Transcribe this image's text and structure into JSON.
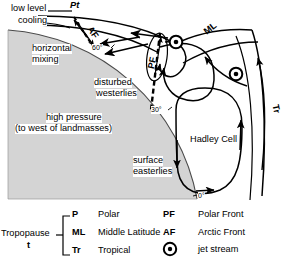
{
  "diagram": {
    "colors": {
      "earth_fill": "#d4d4d4",
      "earth_stroke": "#555555",
      "line": "#000000",
      "background": "#ffffff"
    }
  },
  "annotations": {
    "low_level_cooling": "low level\ncooling",
    "low_level_line1": "low level",
    "low_level_line2": "cooling",
    "pt": "Pt",
    "af": "AF",
    "pf": "PF",
    "ml": "ML",
    "tr": "Tr",
    "horizontal_mixing_1": "horizontal",
    "horizontal_mixing_2": "mixing",
    "disturbed_1": "disturbed",
    "disturbed_2": "westerlies",
    "high_pressure_1": "high pressure",
    "high_pressure_2": "(to west of landmasses)",
    "surface_easterlies_1": "surface",
    "surface_easterlies_2": "easterlies",
    "hadley_cell": "Hadley Cell"
  },
  "latitudes": [
    {
      "label": "60°",
      "value": 60
    },
    {
      "label": "30°",
      "value": 30
    },
    {
      "label": "0°",
      "value": 0
    }
  ],
  "legend": {
    "left": {
      "group_label_1": "Tropopause",
      "group_label_2": "t",
      "items": [
        {
          "code": "P",
          "name": "Polar"
        },
        {
          "code": "ML",
          "name": "Middle Latitude"
        },
        {
          "code": "Tr",
          "name": "Tropical"
        }
      ]
    },
    "right": {
      "items": [
        {
          "code": "PF",
          "name": "Polar Front",
          "icon": "text"
        },
        {
          "code": "AF",
          "name": "Arctic Front",
          "icon": "text"
        },
        {
          "code": "",
          "name": "jet stream",
          "icon": "jet-stream-icon"
        }
      ]
    }
  }
}
